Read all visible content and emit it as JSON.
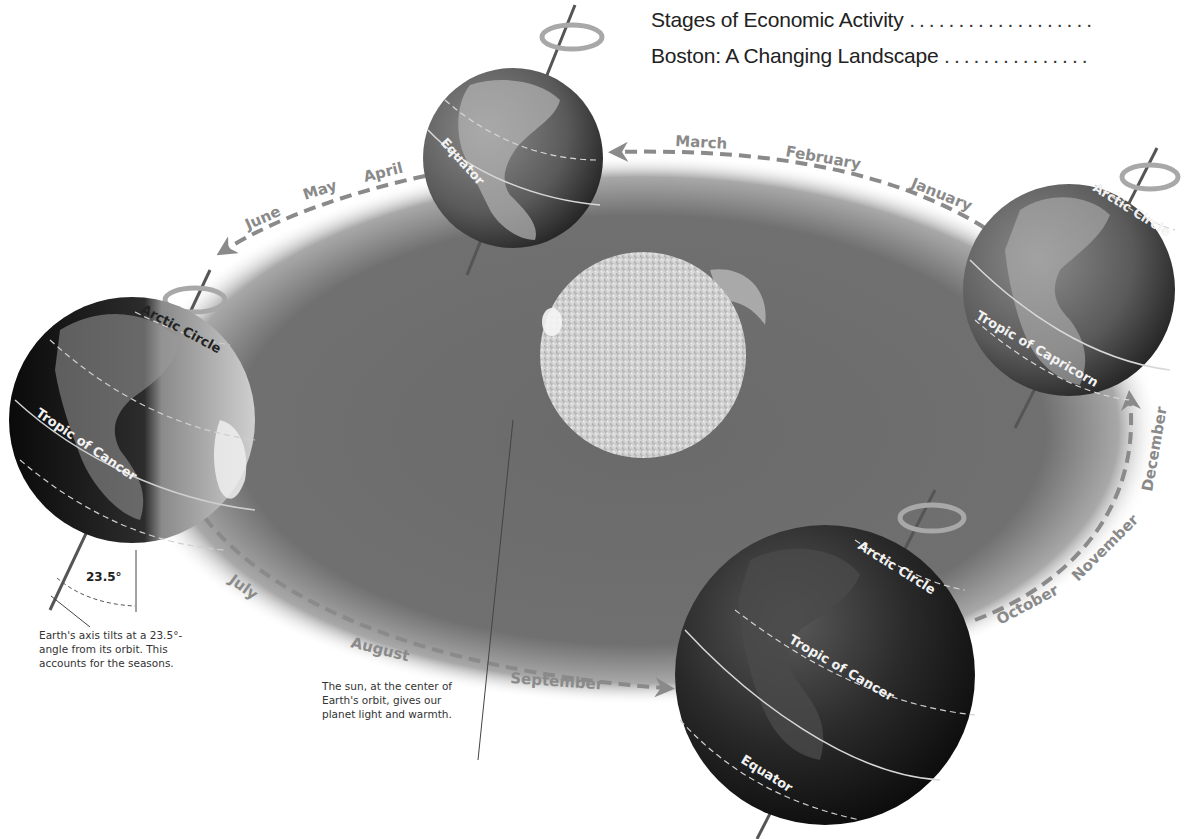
{
  "toc": [
    {
      "title": "Stages of Economic Activity",
      "leader": "..................."
    },
    {
      "title": "Boston: A Changing Landscape",
      "leader": "..............."
    }
  ],
  "months": {
    "january": "January",
    "february": "February",
    "march": "March",
    "april": "April",
    "may": "May",
    "june": "June",
    "july": "July",
    "august": "August",
    "september": "September",
    "october": "October",
    "november": "November",
    "december": "December"
  },
  "globes": {
    "top": {
      "labels": [
        "Equator"
      ]
    },
    "left": {
      "labels": [
        "Arctic Circle",
        "Tropic of Cancer"
      ]
    },
    "right": {
      "labels": [
        "Arctic Circle",
        "Tropic of Capricorn"
      ]
    },
    "bottom": {
      "labels": [
        "Arctic Circle",
        "Tropic of Cancer",
        "Equator"
      ]
    }
  },
  "tilt": {
    "angle_label": "23.5°",
    "caption_lines": [
      "Earth's  axis tilts at a 23.5°-",
      "angle from its orbit.  This",
      "accounts for the seasons."
    ]
  },
  "sun": {
    "caption_lines": [
      "The sun, at the center of",
      "Earth's orbit, gives our",
      "planet light and warmth."
    ]
  },
  "colors": {
    "orbit_plane": "#6e6e6e",
    "orbit_path": "#8a8a8a",
    "globe_dark": "#1a1a1a",
    "sun": "#cfcfcf",
    "background": "#ffffff"
  }
}
